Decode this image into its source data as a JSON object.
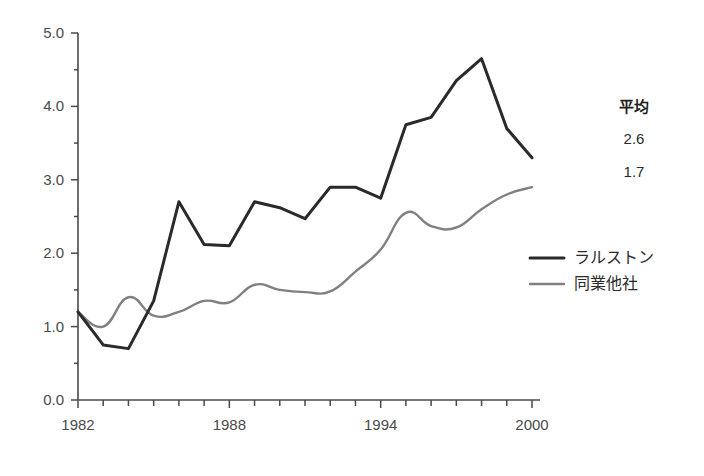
{
  "chart_data": {
    "type": "line",
    "title": "",
    "xlabel": "",
    "ylabel": "",
    "xlim": [
      1982,
      2000
    ],
    "ylim": [
      0.0,
      5.0
    ],
    "grid": false,
    "legend_position": "right",
    "x": [
      1982,
      1983,
      1984,
      1985,
      1986,
      1987,
      1988,
      1989,
      1990,
      1991,
      1992,
      1993,
      1994,
      1995,
      1996,
      1997,
      1998,
      1999,
      2000
    ],
    "y_ticks": [
      "0.0",
      "1.0",
      "2.0",
      "3.0",
      "4.0",
      "5.0"
    ],
    "y_tick_values": [
      0.0,
      1.0,
      2.0,
      3.0,
      4.0,
      5.0
    ],
    "x_ticks": [
      "1982",
      "1988",
      "1994",
      "2000"
    ],
    "x_tick_values": [
      1982,
      1988,
      1994,
      2000
    ],
    "series": [
      {
        "name": "ラルストン",
        "color": "#2a2a2a",
        "width": 3.0,
        "smooth": false,
        "average": "2.6",
        "values": [
          1.2,
          0.75,
          0.7,
          1.35,
          2.7,
          2.12,
          2.1,
          2.7,
          2.62,
          2.47,
          2.9,
          2.9,
          2.75,
          3.75,
          3.85,
          4.35,
          4.65,
          3.7,
          3.3
        ]
      },
      {
        "name": "同業他社",
        "color": "#808080",
        "width": 2.4,
        "smooth": true,
        "average": "1.7",
        "values": [
          1.2,
          1.0,
          1.4,
          1.15,
          1.2,
          1.35,
          1.33,
          1.57,
          1.5,
          1.47,
          1.48,
          1.75,
          2.05,
          2.55,
          2.37,
          2.35,
          2.6,
          2.8,
          2.9
        ]
      }
    ],
    "annotations": {
      "average_header": "平均",
      "average_values": [
        "2.6",
        "1.7"
      ]
    }
  }
}
